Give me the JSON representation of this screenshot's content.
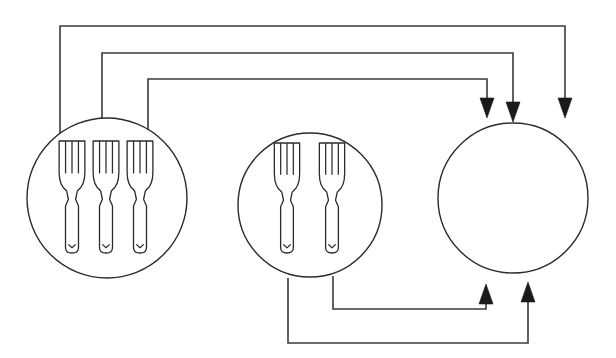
{
  "diagram": {
    "type": "node-link-diagram",
    "canvas": {
      "width": 616,
      "height": 358,
      "background": "#ffffff"
    },
    "style": {
      "line_color": "#3a3a3a",
      "circle_stroke": "#2b2b2b",
      "arrow_fill": "#1a1a1a",
      "fill_color": "#ffffff",
      "stroke_width": 1.6
    },
    "nodes": [
      {
        "id": "plate-left",
        "label": "left-plate",
        "shape": "circle",
        "cx": 107,
        "cy": 198,
        "r": 80,
        "item": "fork",
        "item_count": 3,
        "item_positions": [
          72,
          106,
          140
        ],
        "item_top": 141,
        "item_height": 112
      },
      {
        "id": "plate-middle",
        "label": "middle-plate",
        "shape": "circle",
        "cx": 310,
        "cy": 205,
        "r": 72,
        "item": "fork",
        "item_count": 2,
        "item_positions": [
          287,
          332
        ],
        "item_top": 143,
        "item_height": 110
      },
      {
        "id": "plate-right",
        "label": "right-plate",
        "shape": "circle",
        "cx": 513,
        "cy": 198,
        "r": 75,
        "item": "fork",
        "item_count": 0,
        "item_positions": [],
        "item_top": 0,
        "item_height": 0
      }
    ],
    "edges": [
      {
        "id": "edge-top-outer",
        "from": "plate-left",
        "to": "plate-right",
        "route": "top",
        "points": "60,190 60,26 565,26 565,112",
        "arrow_at": {
          "x": 565,
          "y": 118,
          "dir": "down"
        }
      },
      {
        "id": "edge-top-middle",
        "from": "plate-left",
        "to": "plate-right",
        "route": "top",
        "points": "102,165 102,53 513,53 513,116",
        "arrow_at": {
          "x": 513,
          "y": 122,
          "dir": "down"
        }
      },
      {
        "id": "edge-top-inner",
        "from": "plate-left",
        "to": "plate-right",
        "route": "top",
        "points": "148,148 148,79 487,79 487,112",
        "arrow_at": {
          "x": 487,
          "y": 118,
          "dir": "down"
        }
      },
      {
        "id": "edge-bottom-outer",
        "from": "plate-middle",
        "to": "plate-right",
        "route": "bottom",
        "points": "288,278 288,343 528,343 528,288",
        "arrow_at": {
          "x": 528,
          "y": 282,
          "dir": "up"
        }
      },
      {
        "id": "edge-bottom-inner",
        "from": "plate-middle",
        "to": "plate-right",
        "route": "bottom",
        "points": "333,276 333,309 486,309 486,290",
        "arrow_at": {
          "x": 486,
          "y": 284,
          "dir": "up"
        }
      }
    ],
    "arrow_head": {
      "half_width": 7,
      "length": 20
    }
  }
}
